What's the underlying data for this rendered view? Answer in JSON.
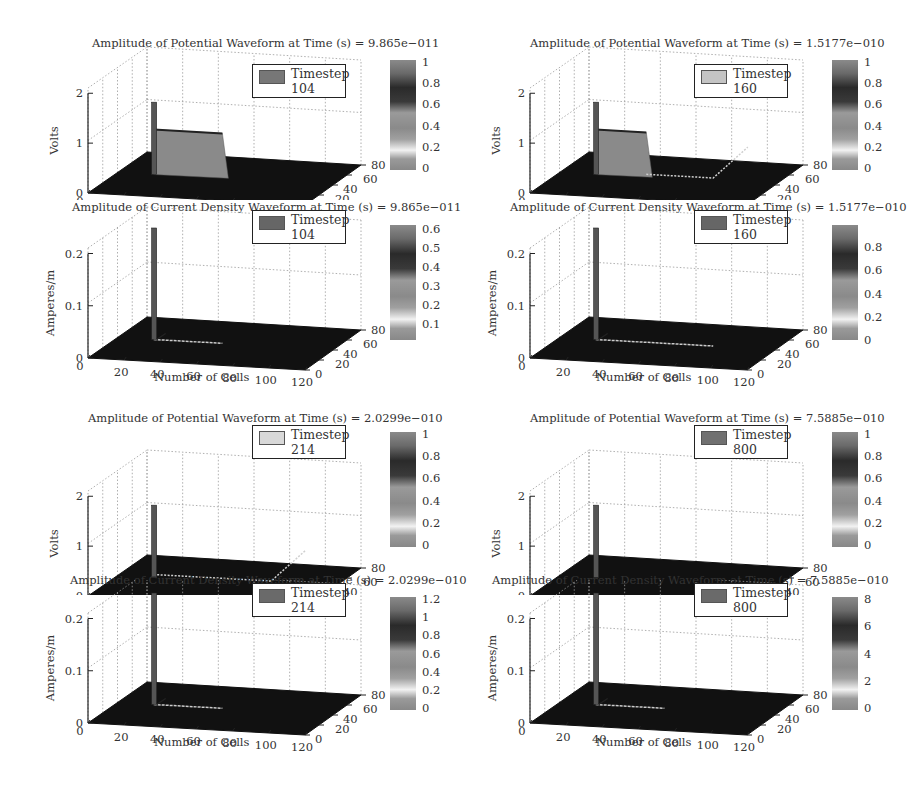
{
  "figure": {
    "x_axis_label": "Number of Cells",
    "x_ticks": [
      "0",
      "20",
      "40",
      "60",
      "80",
      "100",
      "120"
    ],
    "y_ticks": [
      "0",
      "20",
      "40",
      "60",
      "80"
    ]
  },
  "panels": [
    {
      "id": "p1",
      "title": "Amplitude of Potential Waveform at Time (s) = 9.865e−011",
      "zlabel": "Volts",
      "z_ticks": [
        "0",
        "1",
        "2"
      ],
      "legend_line1": "Timestep",
      "legend_line2": "104",
      "legend_swatch": "#777777",
      "colorbar_ticks": [
        "1",
        "0.8",
        "0.6",
        "0.4",
        "0.2",
        "0"
      ],
      "show_xlabel": false
    },
    {
      "id": "p2",
      "title": "Amplitude of Potential Waveform at Time (s) = 1.5177e−010",
      "zlabel": "Volts",
      "z_ticks": [
        "0",
        "1",
        "2"
      ],
      "legend_line1": "Timestep",
      "legend_line2": "160",
      "legend_swatch": "#c4c4c4",
      "colorbar_ticks": [
        "1",
        "0.8",
        "0.6",
        "0.4",
        "0.2",
        "0"
      ],
      "show_xlabel": false
    },
    {
      "id": "p3",
      "title": "Amplitude of Current Density Waveform at Time (s) = 9.865e−011",
      "zlabel": "Amperes/m",
      "z_ticks": [
        "0",
        "0.1",
        "0.2"
      ],
      "legend_line1": "Timestep",
      "legend_line2": "104",
      "legend_swatch": "#666666",
      "colorbar_ticks": [
        "0.6",
        "0.5",
        "0.4",
        "0.3",
        "0.2",
        "0.1"
      ],
      "show_xlabel": true
    },
    {
      "id": "p4",
      "title": "Amplitude of Current Density Waveform at Time (s) = 1.5177e−010",
      "zlabel": "Amperes/m",
      "z_ticks": [
        "0",
        "0.1",
        "0.2"
      ],
      "legend_line1": "Timestep",
      "legend_line2": "160",
      "legend_swatch": "#666666",
      "colorbar_ticks": [
        "0.8",
        "0.6",
        "0.4",
        "0.2",
        "0"
      ],
      "show_xlabel": true
    },
    {
      "id": "p5",
      "title": "Amplitude of Potential Waveform at Time (s) = 2.0299e−010",
      "zlabel": "Volts",
      "z_ticks": [
        "0",
        "1",
        "2"
      ],
      "legend_line1": "Timestep",
      "legend_line2": "214",
      "legend_swatch": "#d8d8d8",
      "colorbar_ticks": [
        "1",
        "0.8",
        "0.6",
        "0.4",
        "0.2",
        "0"
      ],
      "show_xlabel": false
    },
    {
      "id": "p6",
      "title": "Amplitude of Potential Waveform at Time (s) = 7.5885e−010",
      "zlabel": "Volts",
      "z_ticks": [
        "0",
        "1",
        "2"
      ],
      "legend_line1": "Timestep",
      "legend_line2": "800",
      "legend_swatch": "#707070",
      "colorbar_ticks": [
        "1",
        "0.8",
        "0.6",
        "0.4",
        "0.2",
        "0"
      ],
      "show_xlabel": false
    },
    {
      "id": "p7",
      "title": "Amplitude of Current Density Waveform at Time (s) = 2.0299e−010",
      "zlabel": "Amperes/m",
      "z_ticks": [
        "0",
        "0.1",
        "0.2"
      ],
      "legend_line1": "Timestep",
      "legend_line2": "214",
      "legend_swatch": "#6a6a6a",
      "colorbar_ticks": [
        "1.2",
        "1",
        "0.8",
        "0.6",
        "0.4",
        "0.2",
        "0"
      ],
      "show_xlabel": true
    },
    {
      "id": "p8",
      "title": "Amplitude of Current Density Waveform at Time (s) = 7.5885e−010",
      "zlabel": "Amperes/m",
      "z_ticks": [
        "0",
        "0.1",
        "0.2"
      ],
      "legend_line1": "Timestep",
      "legend_line2": "800",
      "legend_swatch": "#6a6a6a",
      "colorbar_ticks": [
        "8",
        "6",
        "4",
        "2",
        "0"
      ],
      "show_xlabel": true
    }
  ],
  "chart_data": [
    {
      "type": "surface",
      "title": "Amplitude of Potential Waveform at Time (s) = 9.865e−011",
      "xlabel": "",
      "ylabel": "",
      "zlabel": "Volts",
      "xlim": [
        0,
        120
      ],
      "ylim": [
        0,
        80
      ],
      "zlim": [
        0,
        2
      ],
      "x_ticks": [
        0,
        20,
        40,
        60,
        80,
        100,
        120
      ],
      "y_ticks": [
        0,
        20,
        40,
        60,
        80
      ],
      "z_ticks": [
        0,
        1,
        2
      ],
      "legend": [
        "Timestep 104"
      ],
      "colorbar": {
        "min": 0,
        "max": 1,
        "ticks": [
          0,
          0.2,
          0.4,
          0.6,
          0.8,
          1
        ]
      },
      "features": [
        {
          "desc": "spike near source",
          "x": 20,
          "z": 1.4
        },
        {
          "desc": "plateau wavefront",
          "x_range": [
            20,
            58
          ],
          "z": 0.9
        },
        {
          "desc": "background",
          "z": 0
        }
      ],
      "grid": true
    },
    {
      "type": "surface",
      "title": "Amplitude of Potential Waveform at Time (s) = 1.5177e−010",
      "xlabel": "",
      "ylabel": "",
      "zlabel": "Volts",
      "xlim": [
        0,
        120
      ],
      "ylim": [
        0,
        80
      ],
      "zlim": [
        0,
        2
      ],
      "x_ticks": [
        0,
        20,
        40,
        60,
        80,
        100,
        120
      ],
      "y_ticks": [
        0,
        20,
        40,
        60,
        80
      ],
      "z_ticks": [
        0,
        1,
        2
      ],
      "legend": [
        "Timestep 160"
      ],
      "colorbar": {
        "min": 0,
        "max": 1,
        "ticks": [
          0,
          0.2,
          0.4,
          0.6,
          0.8,
          1
        ]
      },
      "features": [
        {
          "desc": "spike near source",
          "x": 20,
          "z": 1.4
        },
        {
          "desc": "plateau decaying",
          "x_range": [
            20,
            50
          ],
          "z": 0.9
        },
        {
          "desc": "low ripple trail",
          "x_range": [
            50,
            90
          ],
          "z": 0.1
        },
        {
          "desc": "reflection rising",
          "x_range": [
            80,
            95
          ],
          "z": 0.5
        }
      ],
      "grid": true
    },
    {
      "type": "surface",
      "title": "Amplitude of Current Density Waveform at Time (s) = 9.865e−011",
      "xlabel": "Number of Cells",
      "ylabel": "",
      "zlabel": "Amperes/m",
      "xlim": [
        0,
        120
      ],
      "ylim": [
        0,
        80
      ],
      "zlim": [
        0,
        0.2
      ],
      "x_ticks": [
        0,
        20,
        40,
        60,
        80,
        100,
        120
      ],
      "y_ticks": [
        0,
        20,
        40,
        60,
        80
      ],
      "z_ticks": [
        0,
        0.1,
        0.2
      ],
      "legend": [
        "Timestep 104"
      ],
      "colorbar": {
        "min": 0,
        "max": 0.6,
        "ticks": [
          0.1,
          0.2,
          0.3,
          0.4,
          0.5,
          0.6
        ]
      },
      "features": [
        {
          "desc": "spike near source (clipped)",
          "x": 20,
          "z": 0.6
        },
        {
          "desc": "thin trail",
          "x_range": [
            20,
            58
          ],
          "z": 0.02
        }
      ],
      "grid": true
    },
    {
      "type": "surface",
      "title": "Amplitude of Current Density Waveform at Time (s) = 1.5177e−010",
      "xlabel": "Number of Cells",
      "ylabel": "",
      "zlabel": "Amperes/m",
      "xlim": [
        0,
        120
      ],
      "ylim": [
        0,
        80
      ],
      "zlim": [
        0,
        0.2
      ],
      "x_ticks": [
        0,
        20,
        40,
        60,
        80,
        100,
        120
      ],
      "y_ticks": [
        0,
        20,
        40,
        60,
        80
      ],
      "z_ticks": [
        0,
        0.1,
        0.2
      ],
      "legend": [
        "Timestep 160"
      ],
      "colorbar": {
        "min": 0,
        "max": 0.9,
        "ticks": [
          0,
          0.2,
          0.4,
          0.6,
          0.8
        ]
      },
      "features": [
        {
          "desc": "spike near source (clipped)",
          "x": 20,
          "z": 0.9
        },
        {
          "desc": "thin trail",
          "x_range": [
            20,
            85
          ],
          "z": 0.02
        }
      ],
      "grid": true
    },
    {
      "type": "surface",
      "title": "Amplitude of Potential Waveform at Time (s) = 2.0299e−010",
      "xlabel": "",
      "ylabel": "",
      "zlabel": "Volts",
      "xlim": [
        0,
        120
      ],
      "ylim": [
        0,
        80
      ],
      "zlim": [
        0,
        2
      ],
      "x_ticks": [
        0,
        20,
        40,
        60,
        80,
        100,
        120
      ],
      "y_ticks": [
        0,
        20,
        40,
        60,
        80
      ],
      "z_ticks": [
        0,
        1,
        2
      ],
      "legend": [
        "Timestep 214"
      ],
      "colorbar": {
        "min": 0,
        "max": 1,
        "ticks": [
          0,
          0.2,
          0.4,
          0.6,
          0.8,
          1
        ]
      },
      "features": [
        {
          "desc": "spike near source",
          "x": 20,
          "z": 1.5
        },
        {
          "desc": "ripple trail",
          "x_range": [
            20,
            85
          ],
          "z": 0.1
        },
        {
          "desc": "reflection rising",
          "x_range": [
            85,
            100
          ],
          "z": 0.6
        }
      ],
      "grid": true
    },
    {
      "type": "surface",
      "title": "Amplitude of Potential Waveform at Time (s) = 7.5885e−010",
      "xlabel": "",
      "ylabel": "",
      "zlabel": "Volts",
      "xlim": [
        0,
        120
      ],
      "ylim": [
        0,
        80
      ],
      "zlim": [
        0,
        2
      ],
      "x_ticks": [
        0,
        20,
        40,
        60,
        80,
        100,
        120
      ],
      "y_ticks": [
        0,
        20,
        40,
        60,
        80
      ],
      "z_ticks": [
        0,
        1,
        2
      ],
      "legend": [
        "Timestep 800"
      ],
      "colorbar": {
        "min": 0,
        "max": 1,
        "ticks": [
          0,
          0.2,
          0.4,
          0.6,
          0.8,
          1
        ]
      },
      "features": [
        {
          "desc": "spike near source",
          "x": 20,
          "z": 1.5
        },
        {
          "desc": "background",
          "z": 0
        }
      ],
      "grid": true
    },
    {
      "type": "surface",
      "title": "Amplitude of Current Density Waveform at Time (s) = 2.0299e−010",
      "xlabel": "Number of Cells",
      "ylabel": "",
      "zlabel": "Amperes/m",
      "xlim": [
        0,
        120
      ],
      "ylim": [
        0,
        80
      ],
      "zlim": [
        0,
        0.2
      ],
      "x_ticks": [
        0,
        20,
        40,
        60,
        80,
        100,
        120
      ],
      "y_ticks": [
        0,
        20,
        40,
        60,
        80
      ],
      "z_ticks": [
        0,
        0.1,
        0.2
      ],
      "legend": [
        "Timestep 214"
      ],
      "colorbar": {
        "min": 0,
        "max": 1.3,
        "ticks": [
          0,
          0.2,
          0.4,
          0.6,
          0.8,
          1,
          1.2
        ]
      },
      "features": [
        {
          "desc": "spike near source (clipped)",
          "x": 20,
          "z": 1.3
        },
        {
          "desc": "thin trail",
          "x_range": [
            20,
            60
          ],
          "z": 0.02
        }
      ],
      "grid": true
    },
    {
      "type": "surface",
      "title": "Amplitude of Current Density Waveform at Time (s) = 7.5885e−010",
      "xlabel": "Number of Cells",
      "ylabel": "",
      "zlabel": "Amperes/m",
      "xlim": [
        0,
        120
      ],
      "ylim": [
        0,
        80
      ],
      "zlim": [
        0,
        0.2
      ],
      "x_ticks": [
        0,
        20,
        40,
        60,
        80,
        100,
        120
      ],
      "y_ticks": [
        0,
        20,
        40,
        60,
        80
      ],
      "z_ticks": [
        0,
        0.1,
        0.2
      ],
      "legend": [
        "Timestep 800"
      ],
      "colorbar": {
        "min": 0,
        "max": 8,
        "ticks": [
          0,
          2,
          4,
          6,
          8
        ]
      },
      "features": [
        {
          "desc": "spike near source (clipped)",
          "x": 20,
          "z": 8
        },
        {
          "desc": "thin trail",
          "x_range": [
            20,
            60
          ],
          "z": 0.02
        }
      ],
      "grid": true
    }
  ]
}
